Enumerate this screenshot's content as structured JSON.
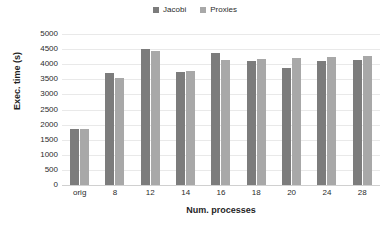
{
  "chart_data": {
    "type": "bar",
    "title": "",
    "xlabel": "Num. processes",
    "ylabel": "Exec. time (s)",
    "categories": [
      "orig",
      "8",
      "12",
      "14",
      "16",
      "18",
      "20",
      "24",
      "28"
    ],
    "series": [
      {
        "name": "Jacobi",
        "color": "#7c7c7c",
        "values": [
          1850,
          3700,
          4490,
          3750,
          4370,
          4120,
          3875,
          4120,
          4125
        ]
      },
      {
        "name": "Proxies",
        "color": "#a8a8a8",
        "values": [
          1860,
          3530,
          4440,
          3770,
          4130,
          4160,
          4200,
          4240,
          4270
        ]
      }
    ],
    "ylim": [
      0,
      5000
    ],
    "ytick_values": [
      5000,
      4500,
      4000,
      3500,
      3000,
      2500,
      2000,
      1500,
      1000,
      500,
      0
    ],
    "ytick_labels": [
      "5000",
      "4500",
      "4000",
      "3500",
      "3000",
      "2500",
      "2000",
      "1500",
      "1000",
      "500",
      "0"
    ],
    "grid": true,
    "legend_position": "top-center"
  },
  "legend": {
    "entries": [
      {
        "label": "Jacobi",
        "color": "#7c7c7c"
      },
      {
        "label": "Proxies",
        "color": "#a8a8a8"
      }
    ]
  }
}
